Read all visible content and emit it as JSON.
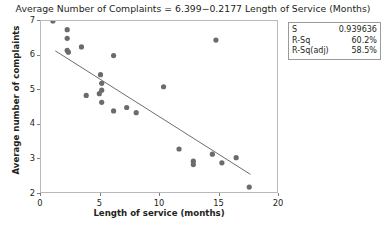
{
  "chart_data": {
    "type": "scatter",
    "title": "Average Number of Complaints =  6.399−0.2177 Length of Service (Months)",
    "xlabel": "Length of service (months)",
    "ylabel": "Average number of complaints",
    "xlim": [
      0,
      20
    ],
    "ylim": [
      2,
      7
    ],
    "xticks": [
      0,
      5,
      10,
      15,
      20
    ],
    "yticks": [
      2,
      3,
      4,
      5,
      6,
      7
    ],
    "grid": false,
    "legend": false,
    "marker_color": "#6b6b6b",
    "line_color": "#6e6e6e",
    "points": [
      {
        "x": 1.0,
        "y": 7.0
      },
      {
        "x": 2.2,
        "y": 6.75
      },
      {
        "x": 2.2,
        "y": 6.5
      },
      {
        "x": 2.2,
        "y": 6.15
      },
      {
        "x": 2.3,
        "y": 6.1
      },
      {
        "x": 3.4,
        "y": 6.25
      },
      {
        "x": 6.1,
        "y": 6.0
      },
      {
        "x": 5.0,
        "y": 5.45
      },
      {
        "x": 3.8,
        "y": 4.85
      },
      {
        "x": 4.9,
        "y": 4.9
      },
      {
        "x": 5.1,
        "y": 5.2
      },
      {
        "x": 5.1,
        "y": 5.0
      },
      {
        "x": 5.1,
        "y": 4.65
      },
      {
        "x": 6.1,
        "y": 4.4
      },
      {
        "x": 7.2,
        "y": 4.5
      },
      {
        "x": 8.0,
        "y": 4.35
      },
      {
        "x": 10.3,
        "y": 5.1
      },
      {
        "x": 14.7,
        "y": 6.45
      },
      {
        "x": 11.6,
        "y": 3.3
      },
      {
        "x": 12.8,
        "y": 2.95
      },
      {
        "x": 12.8,
        "y": 2.85
      },
      {
        "x": 14.4,
        "y": 3.15
      },
      {
        "x": 15.2,
        "y": 2.9
      },
      {
        "x": 16.4,
        "y": 3.05
      },
      {
        "x": 17.5,
        "y": 2.2
      }
    ],
    "fit_line": {
      "intercept": 6.399,
      "slope": -0.2177,
      "x_start": 1.2,
      "x_end": 17.6
    },
    "stats": [
      {
        "label": "S",
        "value": "0.939636"
      },
      {
        "label": "R-Sq",
        "value": "60.2%"
      },
      {
        "label": "R-Sq(adj)",
        "value": "58.5%"
      }
    ]
  }
}
